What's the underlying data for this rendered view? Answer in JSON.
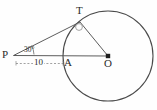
{
  "figure": {
    "background_color": "#fefefe",
    "stroke_color": "#4a4a4a",
    "label_color": "#2b2b2b",
    "points": {
      "P": {
        "label": "P",
        "x": 13,
        "y": 55
      },
      "T": {
        "label": "T",
        "x": 80,
        "y": 22
      },
      "A": {
        "label": "A",
        "x": 66,
        "y": 56
      },
      "O": {
        "label": "O",
        "x": 108,
        "y": 56
      }
    },
    "circle": {
      "center_x": 108,
      "center_y": 56,
      "radius": 45
    },
    "angle": {
      "label": "30°",
      "vertex": "P",
      "value": 30,
      "unit": "degrees"
    },
    "measurement": {
      "label": "10",
      "from": "P",
      "to": "A",
      "style": "dashed"
    },
    "right_angle_marker": {
      "at": "T",
      "shape": "small-circle",
      "indicates": "tangent-perpendicular-to-radius"
    },
    "segments": [
      {
        "name": "tangent-PT",
        "from": "P",
        "to": "T",
        "style": "solid"
      },
      {
        "name": "radius-OT",
        "from": "O",
        "to": "T",
        "style": "solid"
      },
      {
        "name": "line-PO",
        "from": "P",
        "to": "O",
        "style": "solid"
      },
      {
        "name": "measure-PA",
        "from": "P",
        "to": "A",
        "style": "dashed"
      }
    ]
  }
}
